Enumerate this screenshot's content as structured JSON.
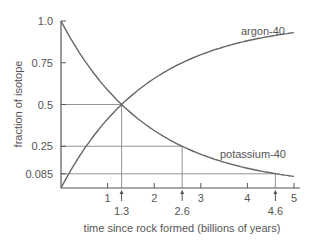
{
  "chart_data": {
    "type": "line",
    "title": "",
    "xlabel": "time since rock formed (billions of years)",
    "ylabel": "fraction of isotope",
    "xlim": [
      0,
      5
    ],
    "ylim": [
      0,
      1.0
    ],
    "x_ticks": [
      "1",
      "2",
      "3",
      "4",
      "5"
    ],
    "y_ticks": [
      "1.0",
      "0.75",
      "0.5",
      "0.25",
      "0.085"
    ],
    "grid": false,
    "annotations": {
      "x_markers": [
        "1.3",
        "2.6",
        "4.6"
      ],
      "reference_lines": [
        {
          "x": 1.3,
          "y": 0.5
        },
        {
          "x": 2.6,
          "y": 0.25
        },
        {
          "x": 4.6,
          "y": 0.085
        }
      ]
    },
    "series": [
      {
        "name": "potassium-40",
        "x": [
          0,
          0.5,
          1.0,
          1.3,
          1.5,
          2.0,
          2.6,
          3.0,
          3.5,
          4.0,
          4.6,
          5.0
        ],
        "values": [
          1.0,
          0.766,
          0.587,
          0.5,
          0.45,
          0.345,
          0.25,
          0.202,
          0.155,
          0.119,
          0.085,
          0.07
        ]
      },
      {
        "name": "argon-40",
        "x": [
          0,
          0.5,
          1.0,
          1.3,
          1.5,
          2.0,
          2.6,
          3.0,
          3.5,
          4.0,
          4.6,
          5.0
        ],
        "values": [
          0.0,
          0.234,
          0.413,
          0.5,
          0.55,
          0.655,
          0.75,
          0.798,
          0.845,
          0.881,
          0.915,
          0.93
        ]
      }
    ]
  },
  "labels": {
    "xlabel": "time since rock formed (billions of years)",
    "ylabel": "fraction of isotope",
    "series_argon": "argon-40",
    "series_potassium": "potassium-40"
  }
}
